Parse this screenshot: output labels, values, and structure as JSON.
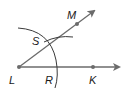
{
  "figure": {
    "type": "geometric-construction",
    "colors": {
      "line": "#6b6b6b",
      "point": "#6b6b6b",
      "label": "#1a1a1a",
      "background": "#ffffff"
    },
    "points": [
      {
        "name": "L",
        "label": "L"
      },
      {
        "name": "M",
        "label": "M"
      },
      {
        "name": "S",
        "label": "S"
      },
      {
        "name": "R",
        "label": "R"
      },
      {
        "name": "K",
        "label": "K"
      }
    ],
    "rays": [
      {
        "from": "L",
        "through": "K"
      },
      {
        "from": "L",
        "through": "M"
      }
    ],
    "arcs": [
      {
        "center": "L",
        "through": [
          "S",
          "R"
        ]
      },
      {
        "center": "R",
        "through": [
          "S"
        ]
      }
    ]
  },
  "labels": {
    "L": "L",
    "M": "M",
    "S": "S",
    "R": "R",
    "K": "K"
  }
}
